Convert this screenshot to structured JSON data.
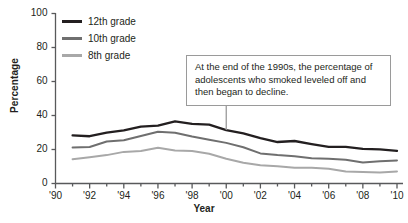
{
  "chart_data": {
    "type": "line",
    "title": "",
    "xlabel": "Year",
    "ylabel": "Percentage",
    "xlim": [
      1990,
      2010
    ],
    "ylim": [
      0,
      100
    ],
    "grid": false,
    "legend_position": "top-left",
    "yticks": [
      "0",
      "20",
      "40",
      "60",
      "80",
      "100"
    ],
    "ytick_values": [
      0,
      20,
      40,
      60,
      80,
      100
    ],
    "xticks": [
      "'90",
      "'92",
      "'94",
      "'96",
      "'98",
      "'00",
      "'02",
      "'04",
      "'06",
      "'08",
      "'10"
    ],
    "xtick_values": [
      1990,
      1992,
      1994,
      1996,
      1998,
      2000,
      2002,
      2004,
      2006,
      2008,
      2010
    ],
    "x": [
      1991,
      1992,
      1993,
      1994,
      1995,
      1996,
      1997,
      1998,
      1999,
      2000,
      2001,
      2002,
      2003,
      2004,
      2005,
      2006,
      2007,
      2008,
      2009,
      2010
    ],
    "series": [
      {
        "name": "12th grade",
        "color": "#231f20",
        "values": [
          28.3,
          27.8,
          29.9,
          31.2,
          33.5,
          34.0,
          36.5,
          35.1,
          34.6,
          31.4,
          29.5,
          26.7,
          24.4,
          25.0,
          23.2,
          21.6,
          21.6,
          20.4,
          20.1,
          19.2
        ]
      },
      {
        "name": "10th grade",
        "color": "#6f6f6f",
        "values": [
          21.2,
          21.5,
          24.7,
          25.4,
          27.9,
          30.4,
          29.8,
          27.6,
          25.7,
          23.9,
          21.3,
          17.7,
          16.7,
          16.0,
          14.9,
          14.5,
          14.0,
          12.3,
          13.1,
          13.6
        ]
      },
      {
        "name": "8th grade",
        "color": "#a8a8a8",
        "values": [
          14.3,
          15.5,
          16.7,
          18.6,
          19.1,
          21.0,
          19.4,
          19.1,
          17.5,
          14.6,
          12.2,
          10.7,
          10.2,
          9.2,
          9.3,
          8.7,
          7.1,
          6.8,
          6.5,
          7.1
        ]
      }
    ],
    "annotations": [
      {
        "text": "At the end of the 1990s, the percentage of adolescents who smoked leveled off and then began to decline.",
        "pointer_x": 2000,
        "pointer_y": 31.4
      }
    ]
  },
  "legend": {
    "items": [
      {
        "label": "12th grade",
        "color": "#231f20"
      },
      {
        "label": "10th grade",
        "color": "#6f6f6f"
      },
      {
        "label": "8th grade",
        "color": "#a8a8a8"
      }
    ]
  },
  "axis_color": "#58595b"
}
